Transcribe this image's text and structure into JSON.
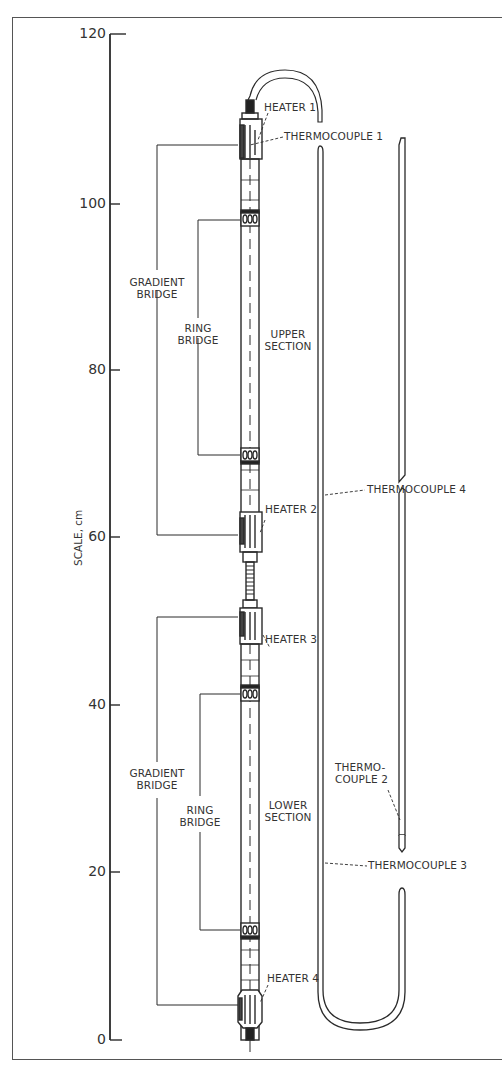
{
  "figure": {
    "type": "apparatus-schematic",
    "scale": {
      "label": "SCALE, cm",
      "ticks": [
        "120",
        "100",
        "80",
        "60",
        "40",
        "20",
        "0"
      ]
    },
    "labels": {
      "heater1": "HEATER 1",
      "thermocouple1": "THERMOCOUPLE 1",
      "heater2": "HEATER 2",
      "heater3": "HEATER 3",
      "heater4": "HEATER 4",
      "thermocouple2_line1": "THERMO-",
      "thermocouple2_line2": "COUPLE 2",
      "thermocouple3": "THERMOCOUPLE 3",
      "thermocouple4": "THERMOCOUPLE 4",
      "gradient_bridge_upper_line1": "GRADIENT",
      "gradient_bridge_upper_line2": "BRIDGE",
      "ring_bridge_upper_line1": "RING",
      "ring_bridge_upper_line2": "BRIDGE",
      "upper_section_line1": "UPPER",
      "upper_section_line2": "SECTION",
      "gradient_bridge_lower_line1": "GRADIENT",
      "gradient_bridge_lower_line2": "BRIDGE",
      "ring_bridge_lower_line1": "RING",
      "ring_bridge_lower_line2": "BRIDGE",
      "lower_section_line1": "LOWER",
      "lower_section_line2": "SECTION"
    },
    "colors": {
      "ink": "#333333",
      "background": "#ffffff"
    }
  }
}
